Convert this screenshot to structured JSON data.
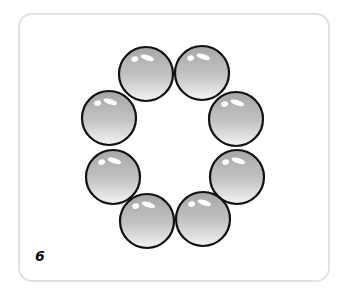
{
  "card": {
    "label": "6",
    "border_color": "#e2e2e2"
  },
  "balls": {
    "count": 8,
    "arrangement": "ring",
    "style": {
      "fill_top": "#a9a9a9",
      "fill_bottom": "#f2f2f2",
      "stroke": "#111111",
      "highlight": "#ffffff"
    },
    "items": [
      {
        "cx": 146,
        "cy": 74,
        "r": 27
      },
      {
        "cx": 202,
        "cy": 73,
        "r": 27
      },
      {
        "cx": 109,
        "cy": 118,
        "r": 27
      },
      {
        "cx": 236,
        "cy": 119,
        "r": 27
      },
      {
        "cx": 113,
        "cy": 177,
        "r": 27
      },
      {
        "cx": 237,
        "cy": 177,
        "r": 27
      },
      {
        "cx": 147,
        "cy": 221,
        "r": 27
      },
      {
        "cx": 203,
        "cy": 219,
        "r": 27
      }
    ]
  }
}
